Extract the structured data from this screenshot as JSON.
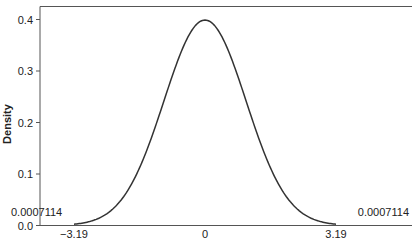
{
  "chart_data": {
    "type": "line",
    "title": "",
    "xlabel": "",
    "ylabel": "Density",
    "xlim": [
      -4.0,
      5.1
    ],
    "ylim": [
      0.0,
      0.425
    ],
    "x_ticks": [
      {
        "value": -3.19,
        "label": "−3.19"
      },
      {
        "value": 0,
        "label": "0"
      },
      {
        "value": 3.19,
        "label": "3.19"
      }
    ],
    "y_ticks": [
      {
        "value": 0.0,
        "label": "0.0"
      },
      {
        "value": 0.1,
        "label": "0.1"
      },
      {
        "value": 0.2,
        "label": "0.2"
      },
      {
        "value": 0.3,
        "label": "0.3"
      },
      {
        "value": 0.4,
        "label": "0.4"
      }
    ],
    "grid": false,
    "legend": null,
    "series": [
      {
        "name": "Standard normal density",
        "distribution": "normal",
        "mean": 0,
        "sd": 1,
        "x_range": [
          -3.19,
          3.19
        ],
        "peak": 0.3989,
        "color": "#333333"
      }
    ],
    "annotations": [
      {
        "text": "0.0007114",
        "x": -3.19,
        "y": 0.0007114,
        "position": "left-tail"
      },
      {
        "text": "0.0007114",
        "x": 3.19,
        "y": 0.0007114,
        "position": "right-tail"
      }
    ]
  }
}
